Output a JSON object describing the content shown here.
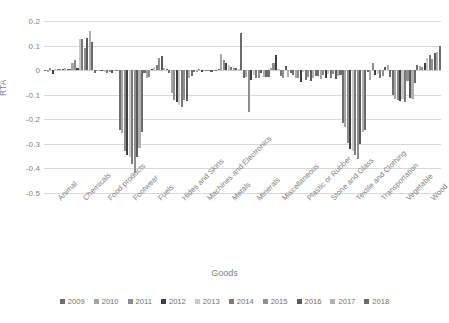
{
  "chart_data": {
    "type": "bar",
    "title": "",
    "xlabel": "Goods",
    "ylabel": "RTA",
    "ylim": [
      -0.5,
      0.2
    ],
    "yticks": [
      0.2,
      0.1,
      0,
      -0.1,
      -0.2,
      -0.3,
      -0.4,
      -0.5
    ],
    "ytick_labels": [
      "0.2",
      "0.1",
      "0",
      "-0.1",
      "-0.2",
      "-0.3",
      "-0.4",
      "-0.5"
    ],
    "grid": true,
    "legend_position": "bottom",
    "categories": [
      "Animal",
      "Chemicals",
      "Food products",
      "Footwear",
      "Fuels",
      "Hides and Skins",
      "Machines and Electronics",
      "Metals",
      "Minerals",
      "Miscellaneous",
      "Plastic or Rubber",
      "Stone and Glass",
      "Textile and Clothing",
      "Transportation",
      "Vegetable",
      "Wood"
    ],
    "series": [
      {
        "name": "2009",
        "color": "#6e6e6e",
        "values": [
          -0.005,
          0.005,
          -0.012,
          -0.245,
          -0.012,
          -0.012,
          -0.008,
          0.006,
          -0.032,
          -0.028,
          -0.02,
          -0.022,
          -0.215,
          -0.006,
          -0.1,
          0.02
        ]
      },
      {
        "name": "2010",
        "color": "#a6a6a6",
        "values": [
          -0.008,
          0.028,
          -0.002,
          -0.255,
          -0.03,
          -0.095,
          -0.006,
          0.065,
          -0.028,
          0.01,
          -0.032,
          -0.036,
          -0.23,
          -0.04,
          -0.118,
          0.016
        ]
      },
      {
        "name": "2011",
        "color": "#8c8c8c",
        "values": [
          0.01,
          0.042,
          -0.004,
          -0.33,
          -0.026,
          -0.12,
          0.004,
          0.04,
          -0.172,
          0.028,
          -0.03,
          -0.018,
          -0.295,
          0.028,
          -0.122,
          0.012
        ]
      },
      {
        "name": "2012",
        "color": "#3f3f3f",
        "values": [
          -0.014,
          0.01,
          -0.004,
          -0.345,
          0.006,
          -0.128,
          -0.006,
          0.03,
          -0.04,
          0.062,
          -0.048,
          -0.032,
          -0.32,
          -0.018,
          -0.126,
          0.028
        ]
      },
      {
        "name": "2013",
        "color": "#c9c9c9",
        "values": [
          0.004,
          0.125,
          -0.006,
          -0.355,
          0.014,
          -0.142,
          0.002,
          0.022,
          -0.018,
          0.004,
          -0.008,
          -0.016,
          -0.33,
          -0.014,
          -0.118,
          0.05
        ]
      },
      {
        "name": "2014",
        "color": "#7a7a7a",
        "values": [
          0.004,
          0.126,
          -0.01,
          -0.38,
          0.022,
          -0.15,
          -0.004,
          0.014,
          -0.03,
          -0.022,
          -0.04,
          -0.03,
          -0.345,
          -0.03,
          -0.128,
          0.06
        ]
      },
      {
        "name": "2015",
        "color": "#8f8f8f",
        "values": [
          0.006,
          0.092,
          -0.008,
          -0.42,
          0.048,
          -0.12,
          -0.002,
          0.01,
          -0.034,
          -0.03,
          -0.026,
          -0.014,
          -0.36,
          -0.022,
          -0.044,
          0.045
        ]
      },
      {
        "name": "2016",
        "color": "#5a5a5a",
        "values": [
          0.006,
          0.13,
          -0.01,
          -0.355,
          0.056,
          -0.126,
          -0.006,
          0.008,
          -0.012,
          0.018,
          -0.044,
          -0.036,
          -0.3,
          0.012,
          -0.112,
          0.07
        ]
      },
      {
        "name": "2017",
        "color": "#b0b0b0",
        "values": [
          0.008,
          0.16,
          -0.004,
          -0.315,
          0.01,
          -0.032,
          -0.004,
          0.004,
          -0.028,
          -0.026,
          -0.03,
          -0.022,
          -0.25,
          0.02,
          -0.116,
          0.075
        ]
      },
      {
        "name": "2018",
        "color": "#6b6b6b",
        "values": [
          0.006,
          0.114,
          -0.002,
          -0.25,
          0.006,
          -0.024,
          -0.002,
          0.15,
          -0.026,
          -0.012,
          -0.022,
          -0.018,
          -0.245,
          -0.026,
          -0.052,
          0.098
        ]
      }
    ]
  }
}
